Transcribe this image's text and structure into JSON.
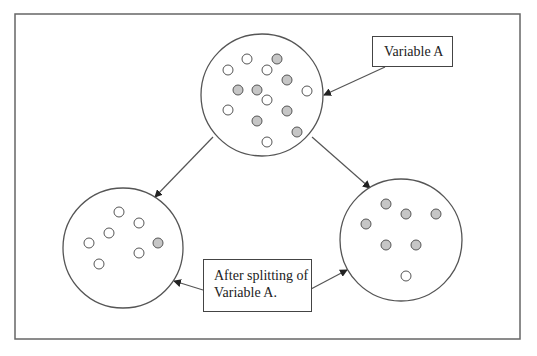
{
  "labels": {
    "variable_a": "Variable A",
    "after_split_line1": "After splitting of",
    "after_split_line2": "Variable A."
  },
  "colors": {
    "stroke": "#555555",
    "frame": "#666666",
    "filled_dot": "#c6c6c6",
    "hollow_dot": "#ffffff"
  },
  "frame": {
    "x": 15,
    "y": 14,
    "width": 505,
    "height": 325
  },
  "nodes": [
    {
      "id": "parent",
      "cx": 262,
      "cy": 95,
      "r": 61,
      "dots": [
        {
          "x": 247,
          "y": 59,
          "filled": false
        },
        {
          "x": 277,
          "y": 59,
          "filled": true
        },
        {
          "x": 228,
          "y": 70,
          "filled": false
        },
        {
          "x": 267,
          "y": 70,
          "filled": false
        },
        {
          "x": 287,
          "y": 80,
          "filled": true
        },
        {
          "x": 238,
          "y": 90,
          "filled": true
        },
        {
          "x": 257,
          "y": 90,
          "filled": true
        },
        {
          "x": 307,
          "y": 91,
          "filled": false
        },
        {
          "x": 267,
          "y": 100,
          "filled": false
        },
        {
          "x": 228,
          "y": 110,
          "filled": false
        },
        {
          "x": 287,
          "y": 111,
          "filled": true
        },
        {
          "x": 257,
          "y": 121,
          "filled": true
        },
        {
          "x": 297,
          "y": 132,
          "filled": true
        },
        {
          "x": 267,
          "y": 142,
          "filled": false
        }
      ]
    },
    {
      "id": "left-child",
      "cx": 123,
      "cy": 248,
      "r": 60,
      "dots": [
        {
          "x": 119,
          "y": 212,
          "filled": false
        },
        {
          "x": 139,
          "y": 223,
          "filled": false
        },
        {
          "x": 109,
          "y": 233,
          "filled": false
        },
        {
          "x": 89,
          "y": 243,
          "filled": false
        },
        {
          "x": 158,
          "y": 243,
          "filled": true
        },
        {
          "x": 139,
          "y": 253,
          "filled": false
        },
        {
          "x": 99,
          "y": 264,
          "filled": false
        }
      ]
    },
    {
      "id": "right-child",
      "cx": 401,
      "cy": 240,
      "r": 61,
      "dots": [
        {
          "x": 386,
          "y": 204,
          "filled": true
        },
        {
          "x": 406,
          "y": 214,
          "filled": true
        },
        {
          "x": 436,
          "y": 214,
          "filled": true
        },
        {
          "x": 366,
          "y": 224,
          "filled": true
        },
        {
          "x": 386,
          "y": 245,
          "filled": true
        },
        {
          "x": 416,
          "y": 245,
          "filled": true
        },
        {
          "x": 406,
          "y": 276,
          "filled": false
        }
      ]
    }
  ],
  "arrows": [
    {
      "id": "parent-to-left",
      "x1": 213,
      "y1": 137,
      "x2": 155,
      "y2": 197
    },
    {
      "id": "parent-to-right",
      "x1": 312,
      "y1": 137,
      "x2": 370,
      "y2": 188
    },
    {
      "id": "label-a-to-parent",
      "x1": 385,
      "y1": 67,
      "x2": 324,
      "y2": 95
    },
    {
      "id": "split-label-to-left",
      "x1": 203,
      "y1": 290,
      "x2": 174,
      "y2": 281
    },
    {
      "id": "split-label-to-right",
      "x1": 311,
      "y1": 289,
      "x2": 347,
      "y2": 270
    }
  ]
}
